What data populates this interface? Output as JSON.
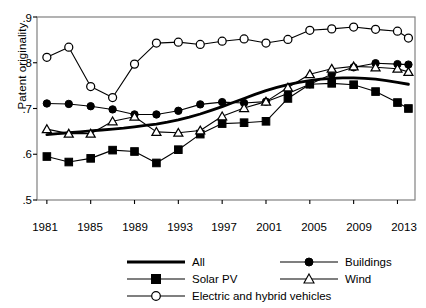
{
  "chart_data": {
    "type": "line",
    "title": "",
    "xlabel": "",
    "ylabel": "Patent originality",
    "xlim": [
      1980,
      2014.5
    ],
    "ylim": [
      0.5,
      0.92
    ],
    "grid": false,
    "legend_position": "below-plot",
    "x_ticks": [
      "1981",
      "1985",
      "1989",
      "1993",
      "1997",
      "2001",
      "2005",
      "2009",
      "2013"
    ],
    "x_tick_values": [
      1981,
      1985,
      1989,
      1993,
      1997,
      2001,
      2005,
      2009,
      2013
    ],
    "y_ticks": [
      ".5",
      ".6",
      ".7",
      ".8",
      ".9"
    ],
    "y_tick_values": [
      0.5,
      0.6,
      0.7,
      0.8,
      0.9
    ],
    "series": [
      {
        "name": "All",
        "marker": "none",
        "line": "thick-solid",
        "color": "#000000",
        "x": [
          1981,
          1982,
          1983,
          1984,
          1985,
          1986,
          1987,
          1988,
          1989,
          1990,
          1991,
          1992,
          1993,
          1994,
          1995,
          1996,
          1997,
          1998,
          1999,
          2000,
          2001,
          2002,
          2003,
          2004,
          2005,
          2006,
          2007,
          2008,
          2009,
          2010,
          2011,
          2012,
          2013,
          2014
        ],
        "values": [
          0.643,
          0.645,
          0.647,
          0.649,
          0.651,
          0.653,
          0.655,
          0.657,
          0.66,
          0.663,
          0.666,
          0.67,
          0.675,
          0.681,
          0.688,
          0.696,
          0.704,
          0.713,
          0.722,
          0.731,
          0.739,
          0.746,
          0.752,
          0.757,
          0.761,
          0.764,
          0.766,
          0.767,
          0.767,
          0.766,
          0.764,
          0.761,
          0.757,
          0.753
        ]
      },
      {
        "name": "Solar PV",
        "marker": "filled-square",
        "line": "solid",
        "color": "#000000",
        "x": [
          1981,
          1983,
          1985,
          1987,
          1989,
          1991,
          1993,
          1995,
          1997,
          1999,
          2001,
          2003,
          2005,
          2007,
          2009,
          2011,
          2013,
          2014
        ],
        "values": [
          0.595,
          0.583,
          0.591,
          0.609,
          0.606,
          0.581,
          0.61,
          0.644,
          0.667,
          0.669,
          0.672,
          0.722,
          0.753,
          0.755,
          0.752,
          0.737,
          0.713,
          0.7
        ]
      },
      {
        "name": "Electric and hybrid vehicles",
        "marker": "open-circle",
        "line": "solid",
        "color": "#000000",
        "x": [
          1981,
          1983,
          1985,
          1987,
          1989,
          1991,
          1993,
          1995,
          1997,
          1999,
          2001,
          2003,
          2005,
          2007,
          2009,
          2011,
          2013,
          2014
        ],
        "values": [
          0.812,
          0.834,
          0.748,
          0.724,
          0.797,
          0.843,
          0.845,
          0.84,
          0.847,
          0.852,
          0.843,
          0.851,
          0.871,
          0.874,
          0.878,
          0.873,
          0.869,
          0.854
        ]
      },
      {
        "name": "Buildings",
        "marker": "filled-circle",
        "line": "solid",
        "color": "#000000",
        "x": [
          1981,
          1983,
          1985,
          1987,
          1989,
          1991,
          1993,
          1995,
          1997,
          1999,
          2001,
          2003,
          2005,
          2007,
          2009,
          2011,
          2013,
          2014
        ],
        "values": [
          0.711,
          0.71,
          0.705,
          0.698,
          0.687,
          0.687,
          0.695,
          0.709,
          0.714,
          0.712,
          0.715,
          0.733,
          0.753,
          0.775,
          0.79,
          0.799,
          0.797,
          0.796
        ]
      },
      {
        "name": "Wind",
        "marker": "open-triangle",
        "line": "solid",
        "color": "#000000",
        "x": [
          1981,
          1983,
          1985,
          1987,
          1989,
          1991,
          1993,
          1995,
          1997,
          1999,
          2001,
          2003,
          2005,
          2007,
          2009,
          2011,
          2013,
          2014
        ],
        "values": [
          0.655,
          0.645,
          0.645,
          0.672,
          0.682,
          0.649,
          0.647,
          0.652,
          0.683,
          0.701,
          0.715,
          0.746,
          0.775,
          0.787,
          0.792,
          0.79,
          0.787,
          0.78
        ]
      }
    ]
  },
  "legend": {
    "entries": [
      {
        "label": "All",
        "marker": "none"
      },
      {
        "label": "Buildings",
        "marker": "filled-circle"
      },
      {
        "label": "Solar PV",
        "marker": "filled-square"
      },
      {
        "label": "Wind",
        "marker": "open-triangle"
      },
      {
        "label": "Electric and hybrid vehicles",
        "marker": "open-circle"
      }
    ]
  }
}
